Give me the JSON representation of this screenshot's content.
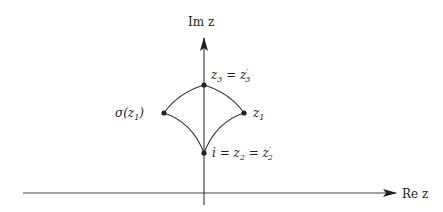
{
  "axes": {
    "imaginary_label": "Im z",
    "real_label": "Re z"
  },
  "points": {
    "top": {
      "label_main": "z",
      "label_sub": "3",
      "label_eq": " = z",
      "label_prime": "′",
      "label_sub2": "3"
    },
    "bottom": {
      "label_i": "i = z",
      "label_sub": "2",
      "label_eq": " = z",
      "label_prime": "′",
      "label_sub2": "2"
    },
    "left": {
      "label": "σ(z",
      "label_sub": "1",
      "label_close": ")"
    },
    "right": {
      "label": "z",
      "label_sub": "1"
    }
  },
  "colors": {
    "stroke": "#333333",
    "point": "#222222"
  }
}
